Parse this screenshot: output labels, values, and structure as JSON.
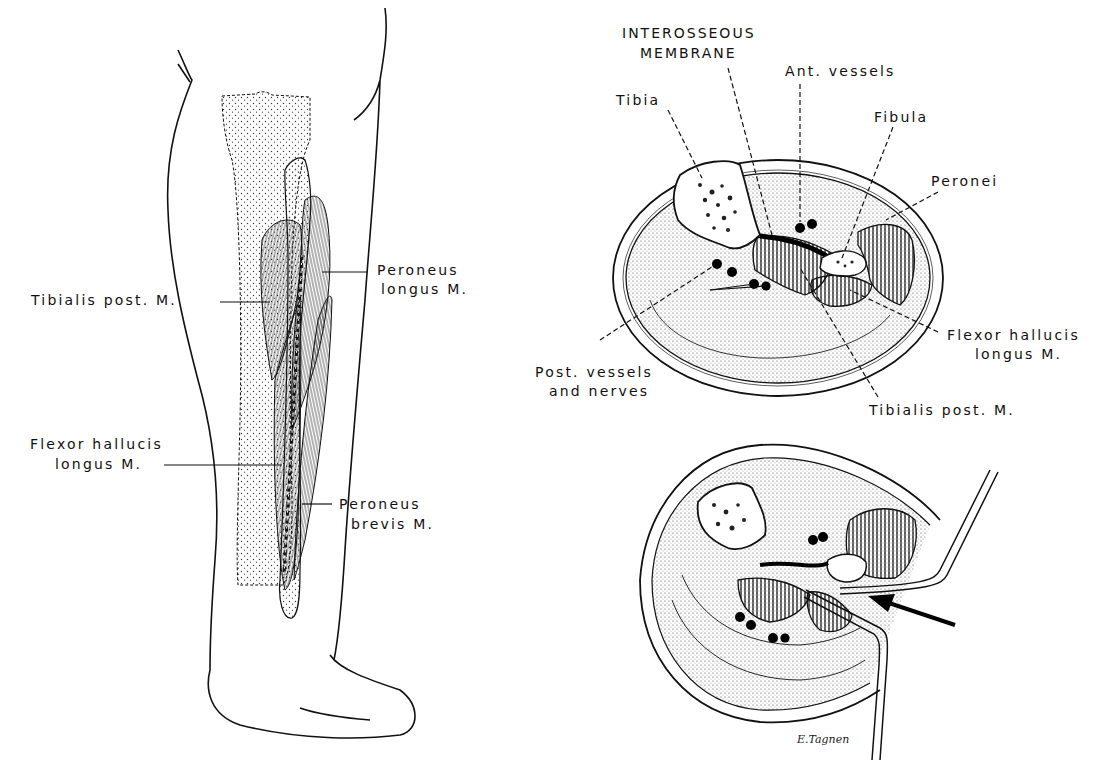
{
  "figure": {
    "left_panel": {
      "description": "Lateral/posterior view of the lower leg showing fibula and deep posterior muscles",
      "labels": {
        "tibialis_post": "Tibialis post. M.",
        "peroneus_longus_line1": "Peroneus",
        "peroneus_longus_line2": "longus M.",
        "flexor_hallucis_line1": "Flexor hallucis",
        "flexor_hallucis_line2": "longus M.",
        "peroneus_brevis_line1": "Peroneus",
        "peroneus_brevis_line2": "brevis M."
      }
    },
    "top_right_panel": {
      "description": "Cross-section of the leg",
      "labels": {
        "interosseous_line1": "INTEROSSEOUS",
        "interosseous_line2": "MEMBRANE",
        "ant_vessels": "Ant. vessels",
        "tibia": "Tibia",
        "fibula": "Fibula",
        "peronei": "Peronei",
        "flexor_hallucis_line1": "Flexor hallucis",
        "flexor_hallucis_line2": "longus M.",
        "post_vessels_line1": "Post. vessels",
        "post_vessels_line2": "and nerves",
        "tibialis_post": "Tibialis post. M."
      }
    },
    "bottom_right_panel": {
      "description": "Cross-section with retractor and approach arrow",
      "signature": "E.Tagnen"
    }
  }
}
